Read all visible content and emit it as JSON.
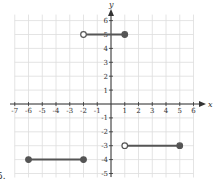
{
  "problem_label": "5.",
  "chart_data": {
    "type": "line",
    "title": "",
    "xlabel": "x",
    "ylabel": "y",
    "xlim": [
      -7,
      6
    ],
    "ylim": [
      -5,
      6
    ],
    "grid": true,
    "x_ticks": [
      -7,
      -6,
      -5,
      -4,
      -3,
      -2,
      -1,
      1,
      2,
      3,
      4,
      5,
      6
    ],
    "y_ticks": [
      -5,
      -4,
      -3,
      -2,
      -1,
      1,
      2,
      3,
      4,
      5,
      6
    ],
    "series": [
      {
        "name": "segment-1",
        "x": [
          -6,
          -2
        ],
        "y": [
          -4,
          -4
        ],
        "start": "closed",
        "end": "closed"
      },
      {
        "name": "segment-2",
        "x": [
          -2,
          1
        ],
        "y": [
          5,
          5
        ],
        "start": "open",
        "end": "closed"
      },
      {
        "name": "segment-3",
        "x": [
          1,
          5
        ],
        "y": [
          -3,
          -3
        ],
        "start": "open",
        "end": "closed"
      }
    ],
    "colors": {
      "line": "#555555",
      "grid": "#dddddd",
      "axis": "#333333"
    }
  }
}
